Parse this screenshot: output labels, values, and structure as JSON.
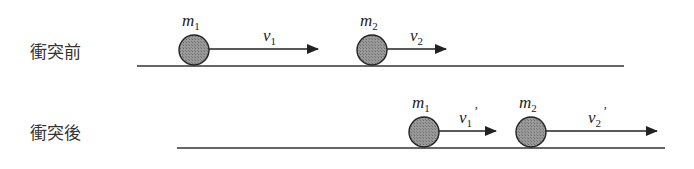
{
  "diagram": {
    "colors": {
      "line": "#333333",
      "ball_fill": "#8a8a8a",
      "ball_stroke": "#222222",
      "text": "#222222"
    },
    "before": {
      "label": "衝突前",
      "ground": {
        "x1": 137,
        "x2": 624,
        "y": 66
      },
      "balls": [
        {
          "mass": "m",
          "mass_sub": "1",
          "velocity": "v",
          "velocity_sub": "1",
          "prime": "",
          "cx": 194,
          "cy": 50,
          "r": 15,
          "arrow_end": 318
        },
        {
          "mass": "m",
          "mass_sub": "2",
          "velocity": "v",
          "velocity_sub": "2",
          "prime": "",
          "cx": 372,
          "cy": 50,
          "r": 15,
          "arrow_end": 446
        }
      ]
    },
    "after": {
      "label": "衝突後",
      "ground": {
        "x1": 177,
        "x2": 665,
        "y": 148
      },
      "balls": [
        {
          "mass": "m",
          "mass_sub": "1",
          "velocity": "v",
          "velocity_sub": "1",
          "prime": "’",
          "cx": 424,
          "cy": 132,
          "r": 15,
          "arrow_end": 496
        },
        {
          "mass": "m",
          "mass_sub": "2",
          "velocity": "v",
          "velocity_sub": "2",
          "prime": "’",
          "cx": 531,
          "cy": 132,
          "r": 15,
          "arrow_end": 657
        }
      ]
    }
  }
}
